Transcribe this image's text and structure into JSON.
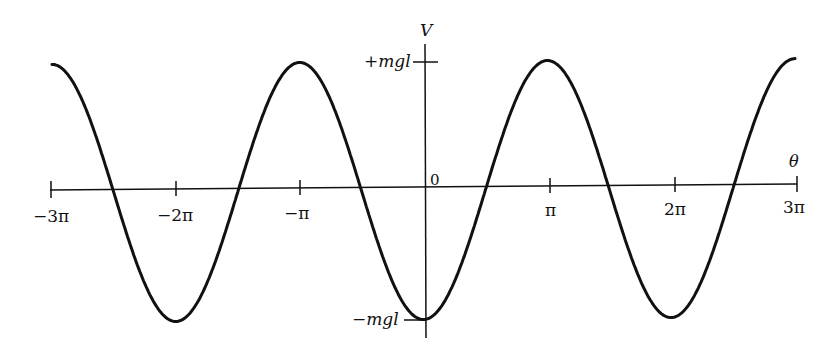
{
  "chart_data": {
    "type": "line",
    "title": "",
    "function": "V(θ) = -mgl·cos(θ)",
    "xlabel": "θ",
    "ylabel": "V",
    "x_ticks": [
      -3,
      -2,
      -1,
      0,
      1,
      2,
      3
    ],
    "x_tick_labels": [
      "−3π",
      "−2π",
      "−π",
      "0",
      "π",
      "2π",
      "3π"
    ],
    "y_tick_labels": [
      "+mgl",
      "−mgl"
    ],
    "y_ticks": [
      1,
      -1
    ],
    "xlim_pi": [
      -3,
      3
    ],
    "ylim": [
      -1,
      1
    ],
    "grid": false,
    "legend": null,
    "series": [
      {
        "name": "V",
        "x_pi": [
          -3,
          -2.5,
          -2,
          -1.5,
          -1,
          -0.5,
          0,
          0.5,
          1,
          1.5,
          2,
          2.5,
          3
        ],
        "values": [
          1,
          0,
          -1,
          0,
          1,
          0,
          -1,
          0,
          1,
          0,
          -1,
          0,
          1
        ]
      }
    ]
  },
  "labels": {
    "v_axis": "V",
    "theta_axis": "θ",
    "origin": "0",
    "plus_mgl": "+mgl",
    "minus_mgl": "−mgl",
    "ticks": [
      "−3π",
      "−2π",
      "−π",
      "π",
      "2π",
      "3π"
    ]
  },
  "style": {
    "ink": "#111111",
    "background": "#ffffff"
  }
}
